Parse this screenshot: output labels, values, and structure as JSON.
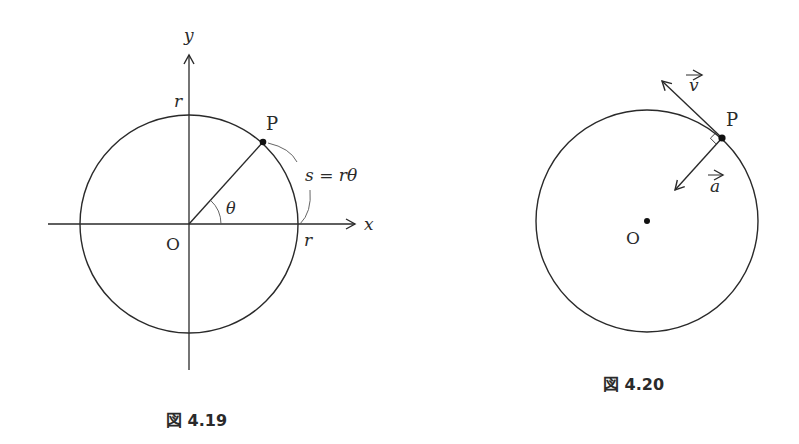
{
  "figure_419": {
    "caption": "図 4.19",
    "axis_x_label": "x",
    "axis_y_label": "y",
    "origin_label": "O",
    "point_label": "P",
    "radius_label_top": "r",
    "radius_label_right": "r",
    "angle_label": "θ",
    "arc_label": "s = rθ"
  },
  "figure_420": {
    "caption": "図 4.20",
    "origin_label": "O",
    "point_label": "P",
    "velocity_label": "v",
    "acceleration_label": "a"
  },
  "colors": {
    "stroke": "#2a2a2a",
    "background": "#ffffff"
  }
}
